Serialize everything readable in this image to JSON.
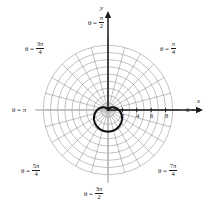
{
  "figure": {
    "type": "polar-plot",
    "background": "#ffffff",
    "grid_color": "#8a8a8a",
    "axis_color": "#1a1a1a",
    "curve_color": "#111111",
    "center_px": [
      108,
      110
    ],
    "unit_px": 7.2
  },
  "axes": {
    "x_label": "x",
    "y_label": "y",
    "x_ticks": [
      "2",
      "4",
      "6",
      "8"
    ],
    "x_tick_values": [
      2,
      4,
      6,
      8
    ]
  },
  "angle_labels": {
    "theta0": {
      "theta": "θ =",
      "value": "0"
    },
    "pi_over_2": {
      "theta": "θ =",
      "num": "π",
      "den": "2"
    },
    "pi_over_4": {
      "theta": "θ =",
      "num": "π",
      "den": "4"
    },
    "three_pi_over_4": {
      "theta": "θ =",
      "num": "3π",
      "den": "4"
    },
    "pi": {
      "theta": "θ =",
      "value": "π"
    },
    "five_pi_over_4": {
      "theta": "θ =",
      "num": "5π",
      "den": "4"
    },
    "three_pi_over_2": {
      "theta": "θ =",
      "num": "3π",
      "den": "2"
    },
    "seven_pi_over_4": {
      "theta": "θ =",
      "num": "7π",
      "den": "4"
    }
  },
  "chart_data": {
    "type": "line",
    "coordinate_system": "polar",
    "title": "",
    "xlabel": "x",
    "ylabel": "y",
    "grid": true,
    "legend": null,
    "radial_ticks": [
      1,
      2,
      3,
      4,
      5,
      6,
      7,
      8,
      9
    ],
    "labeled_radial_ticks": [
      2,
      4,
      6,
      8
    ],
    "angular_gridlines_deg": [
      0,
      15,
      30,
      45,
      60,
      75,
      90,
      105,
      120,
      135,
      150,
      165,
      180,
      195,
      210,
      225,
      240,
      255,
      270,
      285,
      300,
      315,
      330,
      345
    ],
    "angular_labels_deg": [
      0,
      45,
      90,
      135,
      180,
      225,
      270,
      315
    ],
    "rmax": 9,
    "curve": {
      "name": "cardioid",
      "equation": "r = 1.5(1 - sin θ)",
      "cusp_theta_deg": 90,
      "cusp_r": 0,
      "max_r": 3,
      "max_r_theta_deg": 270,
      "r_at_theta": [
        {
          "theta_deg": 0,
          "r": 1.5
        },
        {
          "theta_deg": 30,
          "r": 0.75
        },
        {
          "theta_deg": 60,
          "r": 0.2
        },
        {
          "theta_deg": 90,
          "r": 0
        },
        {
          "theta_deg": 120,
          "r": 0.2
        },
        {
          "theta_deg": 150,
          "r": 0.75
        },
        {
          "theta_deg": 180,
          "r": 1.5
        },
        {
          "theta_deg": 210,
          "r": 2.25
        },
        {
          "theta_deg": 240,
          "r": 2.8
        },
        {
          "theta_deg": 270,
          "r": 3.0
        },
        {
          "theta_deg": 300,
          "r": 2.8
        },
        {
          "theta_deg": 330,
          "r": 2.25
        }
      ]
    }
  }
}
